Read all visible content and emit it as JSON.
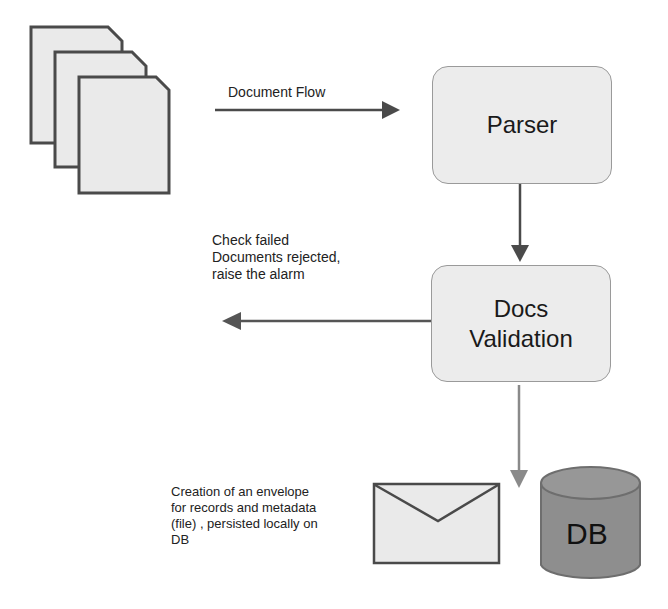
{
  "diagram": {
    "nodes": {
      "documents": {
        "icon": "documents-stack-icon"
      },
      "parser": {
        "label": "Parser"
      },
      "validation": {
        "label_line1": "Docs",
        "label_line2": "Validation"
      },
      "envelope": {
        "icon": "envelope-icon"
      },
      "db": {
        "label": "DB",
        "icon": "database-icon"
      }
    },
    "edges": {
      "document_flow": {
        "label": "Document Flow"
      },
      "rejected": {
        "label_lines": [
          "Check failed",
          "Documents rejected,",
          "raise the alarm"
        ]
      },
      "persist": {
        "label_lines": [
          "Creation of an envelope",
          "for records and metadata",
          "(file) , persisted locally on",
          "DB"
        ]
      }
    },
    "colors": {
      "node_fill": "#ececec",
      "node_border": "#9a9a9a",
      "arrow_dark": "#4a4a4a",
      "arrow_light": "#8a8a8a",
      "db_fill": "#8e8e8e",
      "doc_border": "#4a4a4a"
    }
  }
}
